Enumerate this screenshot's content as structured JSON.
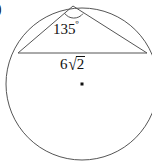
{
  "figure": {
    "kind": "circle-geometry-diagram",
    "item_marker": ")",
    "background_color": "#ffffff",
    "stroke_color": "#555555",
    "text_color": "#111111",
    "circle": {
      "center_x": 82,
      "center_y": 84,
      "radius": 76,
      "center_dot_label": "center-point"
    },
    "chord": {
      "label_coefficient": "6",
      "label_radical_symbol": "√",
      "label_radicand": "2",
      "label_full": "6√2",
      "x1": 18,
      "y1": 53,
      "x2": 147,
      "y2": 53
    },
    "inscribed_angle": {
      "value": "135",
      "degree_symbol": "º",
      "label_full": "135º",
      "apex_x": 73,
      "apex_y": 6
    },
    "arc_marker": {
      "name": "angle-arc"
    }
  }
}
